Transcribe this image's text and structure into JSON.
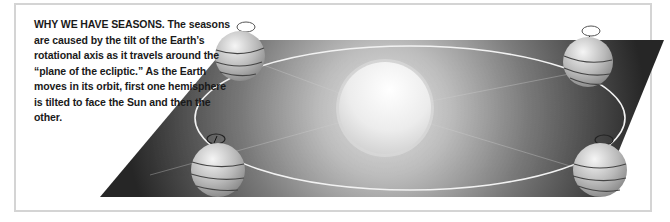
{
  "figure": {
    "title": "WHY WE HAVE SEASONS.",
    "caption_lines": [
      "The seasons are",
      "caused by the tilt of the Earth’s rotational",
      "axis as it travels around the “plane of",
      "the ecliptic.” As the Earth moves in",
      "its orbit, first one hemisphere is",
      "tilted to face the Sun and",
      "then the other."
    ],
    "elements": {
      "sun": "sun-sphere",
      "orbit": "elliptical-orbit",
      "plane": "plane-of-the-ecliptic",
      "earths": [
        {
          "position": "top-left",
          "icon": "earth-globe-icon"
        },
        {
          "position": "top-right",
          "icon": "earth-globe-icon"
        },
        {
          "position": "bottom-left",
          "icon": "earth-globe-icon"
        },
        {
          "position": "bottom-right",
          "icon": "earth-globe-icon"
        }
      ]
    },
    "colors": {
      "plane_dark": "#2a2a2a",
      "plane_glow": "#d8d8d8",
      "sun": "#eeeeee",
      "orbit": "#f2f2f2",
      "frame_border": "#d4d4d4",
      "text": "#1a1a1a"
    }
  }
}
